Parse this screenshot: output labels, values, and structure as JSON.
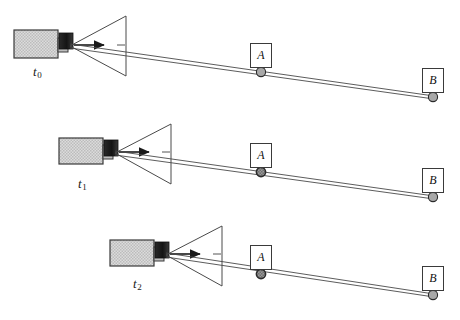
{
  "figure": {
    "type": "diagram",
    "background": "#ffffff",
    "width": 460,
    "height": 320
  },
  "style": {
    "body_fill": "#d6d6d6",
    "body_stroke": "#3a3a3a",
    "emitter_fill": "#1d1d1d",
    "neck_fill": "#bdbdbd",
    "ray_stroke": "#4a4a4a",
    "cone_stroke": "#4a4a4a",
    "marker_fill": "#a8a8a8",
    "marker_stroke": "#2b2b2b",
    "box_stroke": "#3a3a3a",
    "box_fill": "#ffffff",
    "text_color": "#111111"
  },
  "rows": [
    {
      "id": "row-t0",
      "time_label": "t",
      "time_sub": "0",
      "time_label_x": 33,
      "time_label_y": 64,
      "source": {
        "body_x": 14,
        "body_y": 30,
        "body_w": 44,
        "body_h": 28,
        "neck_x": 58,
        "neck_y": 38,
        "neck_w": 10,
        "neck_h": 14,
        "emitter_x": 59,
        "emitter_y": 33,
        "emitter_w": 14,
        "emitter_h": 16
      },
      "cone": {
        "apex_x": 70,
        "apex_y": 46,
        "right_x": 126,
        "top_y": 16,
        "bottom_y": 76
      },
      "arrow": {
        "x1": 74,
        "y1": 45,
        "x2": 104,
        "y2": 45
      },
      "tick": {
        "x1": 117,
        "y1": 45,
        "x2": 125,
        "y2": 45
      },
      "rays": [
        {
          "x1": 70,
          "y1": 44,
          "x2": 434,
          "y2": 96
        },
        {
          "x1": 70,
          "y1": 48,
          "x2": 434,
          "y2": 99
        }
      ],
      "markers": [
        {
          "label": "A",
          "cx": 261,
          "cy": 72,
          "box_x": 250,
          "box_y": 43,
          "shade": "light"
        },
        {
          "label": "B",
          "cx": 433,
          "cy": 97,
          "box_x": 422,
          "box_y": 68,
          "shade": "light"
        }
      ]
    },
    {
      "id": "row-t1",
      "time_label": "t",
      "time_sub": "1",
      "time_label_x": 78,
      "time_label_y": 176,
      "source": {
        "body_x": 59,
        "body_y": 138,
        "body_w": 44,
        "body_h": 26,
        "neck_x": 103,
        "neck_y": 145,
        "neck_w": 10,
        "neck_h": 14,
        "emitter_x": 104,
        "emitter_y": 140,
        "emitter_w": 14,
        "emitter_h": 16
      },
      "cone": {
        "apex_x": 115,
        "apex_y": 153,
        "right_x": 171,
        "top_y": 124,
        "bottom_y": 184
      },
      "arrow": {
        "x1": 119,
        "y1": 152,
        "x2": 149,
        "y2": 152
      },
      "tick": {
        "x1": 162,
        "y1": 152,
        "x2": 170,
        "y2": 152
      },
      "rays": [
        {
          "x1": 115,
          "y1": 151,
          "x2": 434,
          "y2": 196
        },
        {
          "x1": 115,
          "y1": 155,
          "x2": 434,
          "y2": 199
        }
      ],
      "markers": [
        {
          "label": "A",
          "cx": 261,
          "cy": 172,
          "box_x": 250,
          "box_y": 143,
          "shade": "dark"
        },
        {
          "label": "B",
          "cx": 433,
          "cy": 197,
          "box_x": 422,
          "box_y": 168,
          "shade": "light"
        }
      ]
    },
    {
      "id": "row-t2",
      "time_label": "t",
      "time_sub": "2",
      "time_label_x": 133,
      "time_label_y": 276,
      "source": {
        "body_x": 110,
        "body_y": 240,
        "body_w": 44,
        "body_h": 26,
        "neck_x": 154,
        "neck_y": 247,
        "neck_w": 10,
        "neck_h": 14,
        "emitter_x": 155,
        "emitter_y": 242,
        "emitter_w": 14,
        "emitter_h": 16
      },
      "cone": {
        "apex_x": 166,
        "apex_y": 255,
        "right_x": 222,
        "top_y": 226,
        "bottom_y": 286
      },
      "arrow": {
        "x1": 170,
        "y1": 254,
        "x2": 200,
        "y2": 254
      },
      "tick": {
        "x1": 213,
        "y1": 254,
        "x2": 221,
        "y2": 254
      },
      "rays": [
        {
          "x1": 166,
          "y1": 253,
          "x2": 434,
          "y2": 294
        },
        {
          "x1": 166,
          "y1": 257,
          "x2": 434,
          "y2": 297
        }
      ],
      "markers": [
        {
          "label": "A",
          "cx": 261,
          "cy": 274,
          "box_x": 250,
          "box_y": 245,
          "shade": "dark"
        },
        {
          "label": "B",
          "cx": 433,
          "cy": 295,
          "box_x": 422,
          "box_y": 266,
          "shade": "light"
        }
      ]
    }
  ]
}
